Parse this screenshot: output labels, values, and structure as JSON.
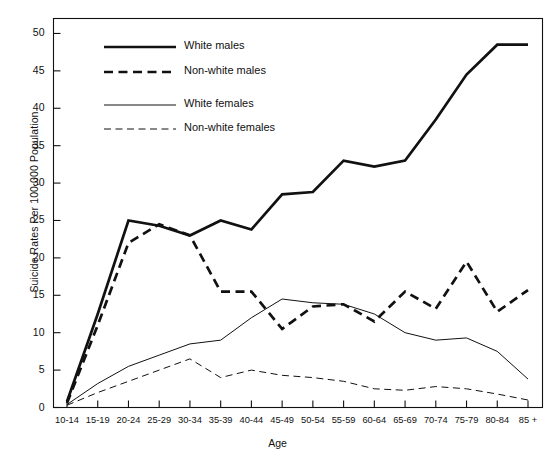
{
  "chart_data": {
    "type": "line",
    "title": "",
    "xlabel": "Age",
    "ylabel": "Suicide Rates Per 100,000 Population",
    "ylim": [
      0,
      52
    ],
    "yticks": [
      0,
      5,
      10,
      15,
      20,
      25,
      30,
      35,
      40,
      45,
      50
    ],
    "grid": false,
    "legend_position": "top-center",
    "categories": [
      "10-14",
      "15-19",
      "20-24",
      "25-29",
      "30-34",
      "35-39",
      "40-44",
      "45-49",
      "50-54",
      "55-59",
      "60-64",
      "65-69",
      "70-74",
      "75-79",
      "80-84",
      "85 +"
    ],
    "series": [
      {
        "name": "White males",
        "style": "solid",
        "width": "thick",
        "color": "#111111",
        "values": [
          0.8,
          12.5,
          25.0,
          24.3,
          23.0,
          25.0,
          23.8,
          28.5,
          28.8,
          33.0,
          32.2,
          33.0,
          38.5,
          44.5,
          48.5,
          48.5
        ]
      },
      {
        "name": "Non-white males",
        "style": "dashed",
        "width": "thick",
        "color": "#111111",
        "values": [
          0.6,
          11.0,
          22.0,
          24.5,
          23.0,
          15.5,
          15.5,
          10.5,
          13.5,
          13.8,
          11.5,
          15.5,
          13.2,
          19.5,
          12.8,
          15.7
        ]
      },
      {
        "name": "White females",
        "style": "solid",
        "width": "thin",
        "color": "#111111",
        "values": [
          0.4,
          3.2,
          5.5,
          7.0,
          8.5,
          9.0,
          12.0,
          14.5,
          14.0,
          13.8,
          12.5,
          10.0,
          9.0,
          9.3,
          7.5,
          3.8
        ]
      },
      {
        "name": "Non-white females",
        "style": "dashed",
        "width": "thin",
        "color": "#111111",
        "values": [
          0.3,
          2.0,
          3.5,
          5.0,
          6.5,
          4.0,
          5.0,
          4.3,
          4.0,
          3.5,
          2.5,
          2.3,
          2.8,
          2.5,
          1.8,
          1.0
        ]
      }
    ]
  },
  "legend": {
    "items": [
      {
        "label": "White males"
      },
      {
        "label": "Non-white males"
      },
      {
        "label": "White females"
      },
      {
        "label": "Non-white females"
      }
    ]
  }
}
